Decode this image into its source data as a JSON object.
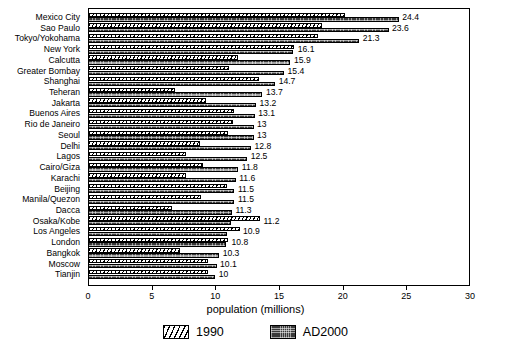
{
  "chart_data": {
    "type": "bar",
    "orientation": "horizontal",
    "title": "",
    "xlabel": "population (millions)",
    "ylabel": "",
    "xlim": [
      0,
      30
    ],
    "xticks": [
      0,
      5,
      10,
      15,
      20,
      25,
      30
    ],
    "grid": false,
    "legend_position": "bottom-center",
    "categories": [
      "Mexico City",
      "Sao Paulo",
      "Tokyo/Yokohama",
      "New York",
      "Calcutta",
      "Greater Bombay",
      "Shanghai",
      "Teheran",
      "Jakarta",
      "Buenos Aires",
      "Rio de Janeiro",
      "Seoul",
      "Delhi",
      "Lagos",
      "Cairo/Giza",
      "Karachi",
      "Beijing",
      "Manila/Quezon",
      "Dacca",
      "Osaka/Kobe",
      "Los Angeles",
      "London",
      "Bangkok",
      "Moscow",
      "Tianjin"
    ],
    "series": [
      {
        "name": "1990",
        "values": [
          20.2,
          18.4,
          18.1,
          16.2,
          11.8,
          11.1,
          13.4,
          6.8,
          9.3,
          11.5,
          11.4,
          11.0,
          8.8,
          7.7,
          9.0,
          7.7,
          10.9,
          8.9,
          6.6,
          13.5,
          11.9,
          11.0,
          7.2,
          9.4,
          9.4
        ]
      },
      {
        "name": "AD2000",
        "values": [
          24.4,
          23.6,
          21.3,
          16.1,
          15.9,
          15.4,
          14.7,
          13.7,
          13.2,
          13.1,
          13.0,
          13.0,
          12.8,
          12.5,
          11.8,
          11.6,
          11.5,
          11.5,
          11.3,
          11.2,
          10.9,
          10.8,
          10.3,
          10.1,
          10.0
        ]
      }
    ],
    "value_labels": [
      "24.4",
      "23.6",
      "21.3",
      "16.1",
      "15.9",
      "15.4",
      "14.7",
      "13.7",
      "13.2",
      "13.1",
      "13",
      "13",
      "12.8",
      "12.5",
      "11.8",
      "11.6",
      "11.5",
      "11.5",
      "11.3",
      "11.2",
      "10.9",
      "10.8",
      "10.3",
      "10.1",
      "10"
    ],
    "xticklabels": [
      "0",
      "5",
      "10",
      "15",
      "20",
      "25",
      "30"
    ],
    "legend": [
      {
        "label": "1990",
        "swatch": "hatched-diagonal",
        "color": "#ffffff"
      },
      {
        "label": "AD2000",
        "swatch": "dark-dotted",
        "color": "#3a3a3a"
      }
    ]
  }
}
